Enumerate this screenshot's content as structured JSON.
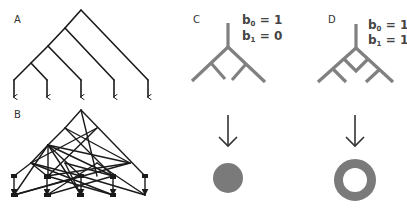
{
  "colors": {
    "network_line": "#1a1a1a",
    "tree_gray": "#808080",
    "shape_fill": "#7a7a7a",
    "arrow": "#333333",
    "background": "#ffffff"
  },
  "panels": {
    "A": {
      "label": "A",
      "description": "rooted binary tree with arrows to 5 leaves"
    },
    "B": {
      "label": "B",
      "description": "network with crossing edges and arrows to leaves"
    },
    "C": {
      "label": "C",
      "betti": [
        {
          "symbol": "b",
          "sub": "0",
          "eq": " = 1"
        },
        {
          "symbol": "b",
          "sub": "1",
          "eq": " = 0"
        }
      ],
      "result_shape": "filled-disk"
    },
    "D": {
      "label": "D",
      "betti": [
        {
          "symbol": "b",
          "sub": "0",
          "eq": " = 1"
        },
        {
          "symbol": "b",
          "sub": "1",
          "eq": " = 1"
        }
      ],
      "result_shape": "ring"
    }
  }
}
